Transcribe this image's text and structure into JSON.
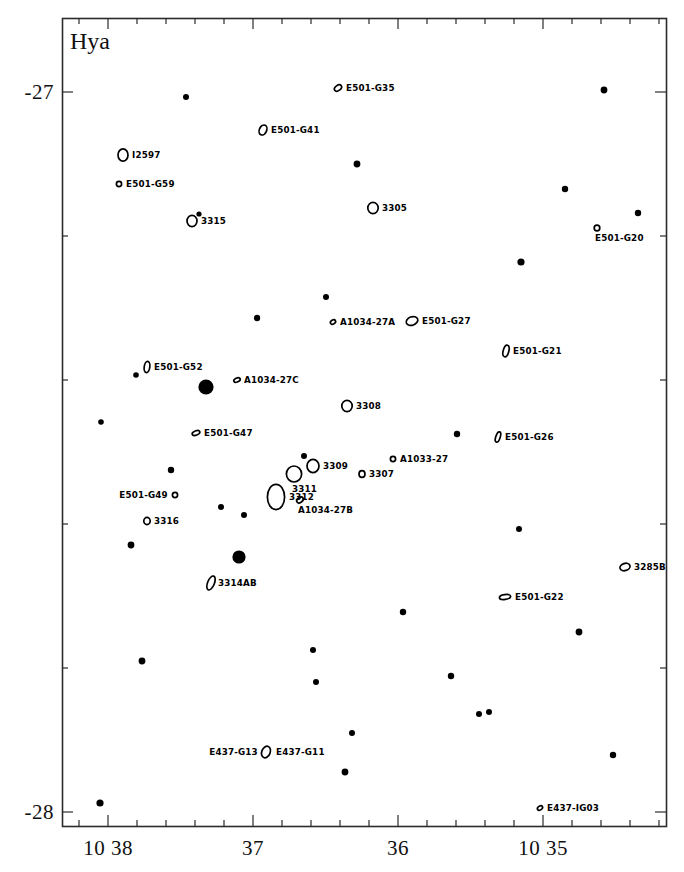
{
  "chart_data": {
    "type": "scatter",
    "title": "Hya",
    "xlabel": "",
    "ylabel": "",
    "grid": false,
    "legend": null,
    "coordinate_system": "equatorial (RA hours/minutes, Dec degrees)",
    "xaxis": {
      "tick_labels": [
        "10 38",
        "37",
        "36",
        "10 35"
      ],
      "tick_x_px": [
        108,
        253,
        398,
        543
      ],
      "minor_tick_count_between": 4,
      "direction": "RA decreasing to the right"
    },
    "yaxis": {
      "tick_labels": [
        "-27",
        "-28"
      ],
      "tick_y_px": [
        92,
        812
      ],
      "minor_tick_count_between": 4
    },
    "frame": {
      "left_px": 62,
      "top_px": 18,
      "right_px": 666,
      "bottom_px": 826
    },
    "galaxies": [
      {
        "label": "E501-G35",
        "x": 338,
        "y": 88,
        "marker": "ellipse",
        "rx": 4.0,
        "ry": 2.6,
        "angle": -35,
        "label_side": "right"
      },
      {
        "label": "E501-G41",
        "x": 263,
        "y": 130,
        "marker": "ellipse",
        "rx": 3.6,
        "ry": 5.2,
        "angle": 25,
        "label_side": "right"
      },
      {
        "label": "I2597",
        "x": 123,
        "y": 155,
        "marker": "ellipse",
        "rx": 5.0,
        "ry": 6.2,
        "angle": 0,
        "label_side": "right"
      },
      {
        "label": "E501-G59",
        "x": 119,
        "y": 184,
        "marker": "ellipse",
        "rx": 2.6,
        "ry": 2.6,
        "angle": 0,
        "label_side": "right"
      },
      {
        "label": "3315",
        "x": 192,
        "y": 221,
        "marker": "ellipse",
        "rx": 5.0,
        "ry": 5.6,
        "angle": 0,
        "label_side": "right"
      },
      {
        "label": "3305",
        "x": 373,
        "y": 208,
        "marker": "ellipse",
        "rx": 5.2,
        "ry": 5.6,
        "angle": 0,
        "label_side": "right"
      },
      {
        "label": "E501-G20",
        "x": 597,
        "y": 228,
        "marker": "ellipse",
        "rx": 2.8,
        "ry": 2.8,
        "angle": 0,
        "label_side": "below"
      },
      {
        "label": "A1034-27A",
        "x": 333,
        "y": 322,
        "marker": "ellipse",
        "rx": 2.8,
        "ry": 1.9,
        "angle": -30,
        "label_side": "right"
      },
      {
        "label": "E501-G27",
        "x": 412,
        "y": 321,
        "marker": "ellipse",
        "rx": 6.0,
        "ry": 4.2,
        "angle": -20,
        "label_side": "right"
      },
      {
        "label": "E501-G21",
        "x": 506,
        "y": 351,
        "marker": "ellipse",
        "rx": 2.8,
        "ry": 6.0,
        "angle": 15,
        "label_side": "right"
      },
      {
        "label": "E501-G52",
        "x": 147,
        "y": 367,
        "marker": "ellipse",
        "rx": 2.8,
        "ry": 5.6,
        "angle": 8,
        "label_side": "right"
      },
      {
        "label": "A1034-27C",
        "x": 237,
        "y": 380,
        "marker": "ellipse",
        "rx": 3.4,
        "ry": 2.0,
        "angle": -25,
        "label_side": "right"
      },
      {
        "label": "3308",
        "x": 347,
        "y": 406,
        "marker": "ellipse",
        "rx": 5.2,
        "ry": 5.6,
        "angle": 0,
        "label_side": "right"
      },
      {
        "label": "E501-G47",
        "x": 196,
        "y": 433,
        "marker": "ellipse",
        "rx": 4.0,
        "ry": 2.2,
        "angle": -20,
        "label_side": "right"
      },
      {
        "label": "E501-G26",
        "x": 498,
        "y": 437,
        "marker": "ellipse",
        "rx": 2.2,
        "ry": 5.4,
        "angle": 18,
        "label_side": "right"
      },
      {
        "label": "3309",
        "x": 313,
        "y": 466,
        "marker": "ellipse",
        "rx": 6.0,
        "ry": 6.6,
        "angle": 0,
        "label_side": "right"
      },
      {
        "label": "A1033-27",
        "x": 393,
        "y": 459,
        "marker": "ellipse",
        "rx": 2.6,
        "ry": 2.6,
        "angle": 0,
        "label_side": "right"
      },
      {
        "label": "3307",
        "x": 362,
        "y": 474,
        "marker": "ellipse",
        "rx": 3.0,
        "ry": 3.4,
        "angle": 0,
        "label_side": "right"
      },
      {
        "label": "3311",
        "x": 294,
        "y": 474,
        "marker": "ellipse",
        "rx": 7.6,
        "ry": 8.0,
        "angle": 0,
        "label_side": "below"
      },
      {
        "label": "3312",
        "x": 276,
        "y": 497,
        "marker": "ellipse",
        "rx": 8.6,
        "ry": 12.6,
        "angle": 0,
        "label_side": "right"
      },
      {
        "label": "E501-G49",
        "x": 175,
        "y": 495,
        "marker": "ellipse",
        "rx": 2.6,
        "ry": 2.6,
        "angle": 0,
        "label_side": "left"
      },
      {
        "label": "A1034-27B",
        "x": 300,
        "y": 500,
        "marker": "ellipse",
        "rx": 3.6,
        "ry": 2.4,
        "angle": -35,
        "label_side": "below"
      },
      {
        "label": "3316",
        "x": 147,
        "y": 521,
        "marker": "ellipse",
        "rx": 3.2,
        "ry": 3.6,
        "angle": 0,
        "label_side": "right"
      },
      {
        "label": "3285B",
        "x": 625,
        "y": 567,
        "marker": "ellipse",
        "rx": 5.2,
        "ry": 3.6,
        "angle": -18,
        "label_side": "right"
      },
      {
        "label": "3314AB",
        "x": 211,
        "y": 583,
        "marker": "ellipse",
        "rx": 3.4,
        "ry": 7.4,
        "angle": 22,
        "label_side": "right"
      },
      {
        "label": "E501-G22",
        "x": 505,
        "y": 597,
        "marker": "ellipse",
        "rx": 5.6,
        "ry": 2.4,
        "angle": -8,
        "label_side": "right"
      },
      {
        "label": "E437-G13",
        "x": 266,
        "y": 752,
        "marker": "ellipse",
        "rx": 4.2,
        "ry": 6.0,
        "angle": 22,
        "label_side": "left"
      },
      {
        "label": "E437-G11",
        "x": 269,
        "y": 752,
        "marker": "none",
        "rx": 0,
        "ry": 0,
        "angle": 0,
        "label_side": "right"
      },
      {
        "label": "E437-IG03",
        "x": 540,
        "y": 808,
        "marker": "ellipse",
        "rx": 2.8,
        "ry": 1.9,
        "angle": -32,
        "label_side": "right"
      }
    ],
    "stars": [
      {
        "x": 186,
        "y": 97,
        "r": 3.0
      },
      {
        "x": 604,
        "y": 90,
        "r": 3.4
      },
      {
        "x": 357,
        "y": 164,
        "r": 3.4
      },
      {
        "x": 565,
        "y": 189,
        "r": 3.2
      },
      {
        "x": 638,
        "y": 213,
        "r": 3.2
      },
      {
        "x": 199,
        "y": 214,
        "r": 2.6
      },
      {
        "x": 521,
        "y": 262,
        "r": 3.6
      },
      {
        "x": 326,
        "y": 297,
        "r": 3.0
      },
      {
        "x": 257,
        "y": 318,
        "r": 3.2
      },
      {
        "x": 136,
        "y": 375,
        "r": 2.8
      },
      {
        "x": 206,
        "y": 387,
        "r": 7.6
      },
      {
        "x": 101,
        "y": 422,
        "r": 2.8
      },
      {
        "x": 457,
        "y": 434,
        "r": 3.2
      },
      {
        "x": 304,
        "y": 456,
        "r": 3.0
      },
      {
        "x": 171,
        "y": 470,
        "r": 3.2
      },
      {
        "x": 221,
        "y": 507,
        "r": 3.0
      },
      {
        "x": 244,
        "y": 515,
        "r": 3.0
      },
      {
        "x": 519,
        "y": 529,
        "r": 3.0
      },
      {
        "x": 131,
        "y": 545,
        "r": 3.4
      },
      {
        "x": 239,
        "y": 557,
        "r": 6.6
      },
      {
        "x": 403,
        "y": 612,
        "r": 3.2
      },
      {
        "x": 579,
        "y": 632,
        "r": 3.4
      },
      {
        "x": 142,
        "y": 661,
        "r": 3.4
      },
      {
        "x": 313,
        "y": 650,
        "r": 3.0
      },
      {
        "x": 316,
        "y": 682,
        "r": 3.0
      },
      {
        "x": 451,
        "y": 676,
        "r": 3.2
      },
      {
        "x": 479,
        "y": 714,
        "r": 3.0
      },
      {
        "x": 489,
        "y": 712,
        "r": 3.0
      },
      {
        "x": 352,
        "y": 733,
        "r": 3.0
      },
      {
        "x": 613,
        "y": 755,
        "r": 3.2
      },
      {
        "x": 345,
        "y": 772,
        "r": 3.4
      },
      {
        "x": 100,
        "y": 803,
        "r": 3.6
      }
    ]
  }
}
